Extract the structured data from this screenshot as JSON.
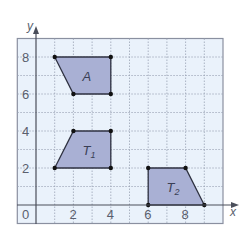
{
  "diagram": {
    "type": "coordinate-grid-shapes",
    "axes": {
      "x_label": "x",
      "y_label": "y",
      "origin_label": "0",
      "x_ticks": [
        "2",
        "4",
        "6",
        "8"
      ],
      "y_ticks": [
        "2",
        "4",
        "6",
        "8"
      ],
      "x_range": [
        -1,
        10
      ],
      "y_range": [
        -1,
        9
      ]
    },
    "shapes": [
      {
        "name": "A",
        "label": "A",
        "sub": "",
        "vertices": [
          [
            1,
            8
          ],
          [
            4,
            8
          ],
          [
            4,
            6
          ],
          [
            2,
            6
          ]
        ]
      },
      {
        "name": "T1",
        "label": "T",
        "sub": "1",
        "vertices": [
          [
            1,
            2
          ],
          [
            2,
            4
          ],
          [
            4,
            4
          ],
          [
            4,
            2
          ]
        ]
      },
      {
        "name": "T2",
        "label": "T",
        "sub": "2",
        "vertices": [
          [
            6,
            0
          ],
          [
            6,
            2
          ],
          [
            8,
            2
          ],
          [
            9,
            0
          ]
        ]
      }
    ],
    "colors": {
      "grid_background": "#eaf2fb",
      "grid_line": "#9aa3b5",
      "axis": "#4a4e5a",
      "shape_fill": "#a9b0d4",
      "shape_stroke": "#2e3140",
      "vertex": "#111111",
      "border": "#8a90a0"
    }
  }
}
